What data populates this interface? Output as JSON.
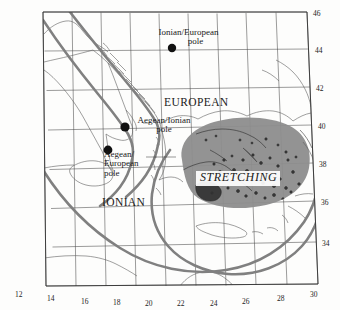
{
  "figure": {
    "type": "map",
    "region": "Central Mediterranean / Aegean",
    "projection_note": "graticule",
    "background_color": "#ffffff",
    "coast_color": "#5a5a5a",
    "grid_color": "#4a4a4a",
    "boundary_color": "#7d7d7d",
    "stretching_fill": "#8c8c8c"
  },
  "axes": {
    "longitude_ticks": [
      "12",
      "14",
      "16",
      "18",
      "20",
      "22",
      "24",
      "26",
      "28",
      "30"
    ],
    "latitude_ticks": [
      "46",
      "44",
      "42",
      "40",
      "38",
      "36",
      "34"
    ],
    "lon_range": [
      12,
      30
    ],
    "lat_range": [
      32,
      46
    ]
  },
  "plate_labels": [
    {
      "name": "european-plate-label",
      "text": "EUROPEAN",
      "lon": 21.0,
      "lat": 41.2
    },
    {
      "name": "ionian-plate-label",
      "text": "IONIAN",
      "lon": 18.4,
      "lat": 36.9
    }
  ],
  "region_labels": [
    {
      "name": "stretching-region-label",
      "text": "STRETCHING",
      "lon": 24.2,
      "lat": 37.9
    }
  ],
  "poles": [
    {
      "name": "ionian-european-pole",
      "label_line1": "Ionian/European",
      "label_line2": "pole",
      "lon": 21.6,
      "lat": 44.5
    },
    {
      "name": "aegean-ionian-pole",
      "label_line1": "Aegean/Ionian",
      "label_line2": "pole",
      "lon": 18.7,
      "lat": 39.9
    },
    {
      "name": "aegean-european-pole",
      "label_line1": "Aegean/",
      "label_line2": "European",
      "label_line3": "pole",
      "lon": 17.7,
      "lat": 38.4
    }
  ]
}
